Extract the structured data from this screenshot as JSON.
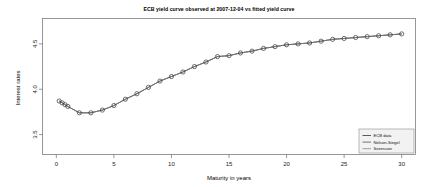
{
  "chart_data": {
    "type": "line",
    "title": "ECB yield curve observed at 2007-12-04 vs fitted yield curve",
    "xlabel": "Maturity in years",
    "ylabel": "Interest rates",
    "xlim": [
      -1.2,
      31.2
    ],
    "ylim": [
      3.28,
      4.78
    ],
    "xticks": [
      0,
      5,
      10,
      15,
      20,
      25,
      30
    ],
    "xtick_labels": [
      "0",
      "5",
      "10",
      "15",
      "20",
      "25",
      "30"
    ],
    "yticks": [
      3.5,
      4.0,
      4.5
    ],
    "ytick_labels": [
      "3.5",
      "4.0",
      "4.5"
    ],
    "grid": false,
    "legend_position": "bottom-right",
    "marker": "open-circle",
    "series": [
      {
        "name": "ECB data",
        "color": "#333333",
        "x": [
          0.25,
          0.5,
          0.75,
          1,
          2,
          3,
          4,
          5,
          6,
          7,
          8,
          9,
          10,
          11,
          12,
          13,
          14,
          15,
          16,
          17,
          18,
          19,
          20,
          21,
          22,
          23,
          24,
          25,
          26,
          27,
          28,
          29,
          30
        ],
        "values": [
          3.87,
          3.85,
          3.83,
          3.81,
          3.74,
          3.74,
          3.77,
          3.82,
          3.89,
          3.95,
          4.02,
          4.09,
          4.14,
          4.19,
          4.25,
          4.3,
          4.36,
          4.37,
          4.4,
          4.42,
          4.45,
          4.47,
          4.49,
          4.5,
          4.51,
          4.53,
          4.55,
          4.56,
          4.57,
          4.58,
          4.59,
          4.6,
          4.61
        ]
      },
      {
        "name": "Nelson-Siegel",
        "color": "#555555",
        "x": [
          0.25,
          0.5,
          0.75,
          1,
          2,
          3,
          4,
          5,
          6,
          7,
          8,
          9,
          10,
          11,
          12,
          13,
          14,
          15,
          16,
          17,
          18,
          19,
          20,
          21,
          22,
          23,
          24,
          25,
          26,
          27,
          28,
          29,
          30
        ],
        "values": [
          3.87,
          3.85,
          3.83,
          3.81,
          3.74,
          3.74,
          3.77,
          3.82,
          3.89,
          3.95,
          4.02,
          4.09,
          4.14,
          4.19,
          4.25,
          4.3,
          4.36,
          4.37,
          4.4,
          4.42,
          4.45,
          4.47,
          4.49,
          4.5,
          4.51,
          4.53,
          4.55,
          4.56,
          4.57,
          4.58,
          4.59,
          4.6,
          4.61
        ]
      },
      {
        "name": "Svensson",
        "color": "#888888",
        "x": [
          0.25,
          0.5,
          0.75,
          1,
          2,
          3,
          4,
          5,
          6,
          7,
          8,
          9,
          10,
          11,
          12,
          13,
          14,
          15,
          16,
          17,
          18,
          19,
          20,
          21,
          22,
          23,
          24,
          25,
          26,
          27,
          28,
          29,
          30
        ],
        "values": [
          3.87,
          3.85,
          3.83,
          3.81,
          3.74,
          3.74,
          3.77,
          3.82,
          3.89,
          3.95,
          4.02,
          4.09,
          4.14,
          4.19,
          4.25,
          4.3,
          4.36,
          4.37,
          4.4,
          4.42,
          4.45,
          4.47,
          4.49,
          4.5,
          4.51,
          4.53,
          4.55,
          4.56,
          4.57,
          4.58,
          4.59,
          4.6,
          4.61
        ]
      }
    ],
    "legend": [
      {
        "label": "ECB data",
        "color": "#333333"
      },
      {
        "label": "Nelson-Siegel",
        "color": "#555555"
      },
      {
        "label": "Svensson",
        "color": "#888888"
      }
    ]
  }
}
